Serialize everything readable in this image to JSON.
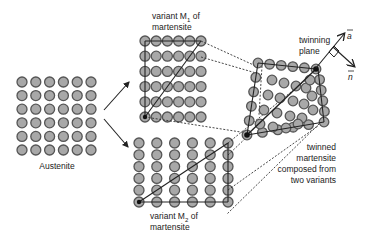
{
  "diagram": {
    "type": "crystal-structure-transformation",
    "austenite": {
      "label": "Austenite",
      "rows": 6,
      "cols": 6
    },
    "variant_m1": {
      "label_line1": "variant M",
      "sub": "1",
      "label_line1_suffix": " of",
      "label_line2": "martensite",
      "rows": 6,
      "cols": 6
    },
    "variant_m2": {
      "label_line1": "variant M",
      "sub": "2",
      "label_line1_suffix": " of",
      "label_line2": "martensite",
      "rows": 6,
      "cols": 6
    },
    "twinning_plane": {
      "label_line1": "twinning",
      "label_line2": "plane"
    },
    "twinned": {
      "label_lines": [
        "twinned",
        "martensite",
        "composed from",
        "two variants"
      ]
    },
    "vectors": {
      "a": "a",
      "n": "n"
    },
    "colors": {
      "atom_fill": "#a8a8a8",
      "atom_stroke": "#555555",
      "line": "#222222",
      "text": "#222222"
    }
  }
}
